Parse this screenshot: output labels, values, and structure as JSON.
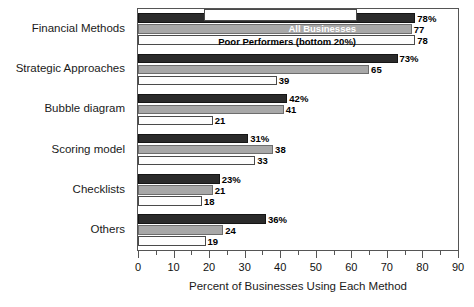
{
  "chart_data": {
    "type": "bar",
    "orientation": "horizontal",
    "title": "",
    "xlabel": "Percent of Businesses Using Each Method",
    "ylabel": "",
    "xlim": [
      0,
      90
    ],
    "xticks": [
      0,
      10,
      20,
      30,
      40,
      50,
      60,
      70,
      80,
      90
    ],
    "xtick_labels": [
      "0",
      "10",
      "20",
      "30",
      "40",
      "50",
      "60",
      "70",
      "80",
      "90"
    ],
    "minor_tick_step": 5,
    "grid": false,
    "legend_position": "top-right-overlay",
    "categories": [
      "Financial Methods",
      "Strategic Approaches",
      "Bubble diagram",
      "Scoring model",
      "Checklists",
      "Others"
    ],
    "series": [
      {
        "name": "Top Performers (top 20%)",
        "color": "#2b2b2b",
        "values": [
          78,
          73,
          42,
          31,
          23,
          36
        ],
        "labels": [
          "78%",
          "73%",
          "42%",
          "31%",
          "23%",
          "36%"
        ]
      },
      {
        "name": "All Businesses",
        "color": "#a8a8a8",
        "values": [
          77,
          65,
          41,
          38,
          21,
          24
        ],
        "labels": [
          "77",
          "65",
          "41",
          "38",
          "21",
          "24"
        ]
      },
      {
        "name": "Poor Performers (bottom 20%)",
        "color": "#fdfdfd",
        "values": [
          78,
          39,
          21,
          33,
          18,
          19
        ],
        "labels": [
          "78",
          "39",
          "21",
          "33",
          "18",
          "19"
        ]
      }
    ],
    "legend_entries": [
      "",
      "All Businesses",
      "Poor Performers (bottom 20%)"
    ]
  }
}
